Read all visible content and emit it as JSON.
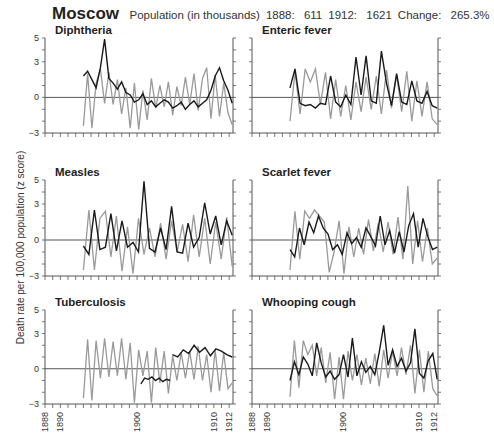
{
  "header": {
    "city": "Moscow",
    "population_label": "Population (in thousands)",
    "pop_1888_label": "1888:",
    "pop_1888": "611",
    "pop_1912_label": "1912:",
    "pop_1912": "1621",
    "change_label": "Change:",
    "change": "265.3%"
  },
  "y_axis_label": "Death rate per 100,000 population (z score)",
  "colors": {
    "black_series": "#1a1a1a",
    "gray_series": "#9a9a9a",
    "axis": "#555555"
  },
  "chart_data": {
    "type": "line",
    "title": "Moscow",
    "subtitle": "Population (in thousands) 1888: 611 1912: 1621 Change: 265.3%",
    "xlabel": "",
    "ylabel": "Death rate per 100,000 population (z score)",
    "xlim": [
      1888,
      1912.5
    ],
    "ylim": [
      -3,
      5
    ],
    "x_ticks": [
      1888,
      1890,
      1900,
      1910,
      1912
    ],
    "y_ticks": [
      -3,
      0,
      3,
      5
    ],
    "grid": false,
    "legend": "none",
    "panels": [
      {
        "title": "Diphtheria",
        "start": 1893,
        "series": [
          {
            "name": "black",
            "values": [
              1.8,
              2.2,
              1.5,
              0.8,
              2.5,
              4.9,
              1.6,
              1.2,
              0.7,
              1.3,
              0.4,
              0.2,
              -0.4,
              -0.2,
              0.3,
              -0.6,
              -0.3,
              -0.8,
              -0.5,
              -0.2,
              -0.4,
              -0.9,
              -0.7,
              -0.4,
              -1.0,
              -0.6,
              -0.3,
              -0.8,
              -0.5,
              -0.2,
              0.6,
              1.8,
              2.5,
              1.4,
              0.6,
              -0.5
            ]
          },
          {
            "name": "gray",
            "values": [
              -2.4,
              2.0,
              -2.6,
              1.2,
              2.4,
              -0.5,
              2.1,
              -0.6,
              1.5,
              -1.4,
              0.8,
              -2.6,
              1.2,
              -2.7,
              0.6,
              -1.9,
              1.6,
              -0.9,
              1.0,
              -0.8,
              1.3,
              -1.5,
              0.9,
              -0.7,
              1.7,
              -0.6,
              2.0,
              -1.1,
              1.6,
              2.5,
              -1.8,
              1.9,
              -1.6,
              1.2,
              -1.3,
              -2.3
            ]
          }
        ]
      },
      {
        "title": "Enteric fever",
        "start": 1893,
        "series": [
          {
            "name": "black",
            "values": [
              0.8,
              2.4,
              -0.5,
              -0.7,
              -0.6,
              -0.9,
              -0.5,
              -0.6,
              1.8,
              -0.4,
              -0.8,
              0.2,
              -0.6,
              3.4,
              0.2,
              3.5,
              -0.3,
              -0.5,
              3.9,
              1.2,
              -0.7,
              2.0,
              -0.4,
              -0.6,
              1.4,
              -0.3,
              -0.5,
              0.5,
              -0.7,
              -0.9
            ]
          },
          {
            "name": "gray",
            "values": [
              -2.0,
              2.2,
              -1.4,
              2.4,
              1.3,
              2.4,
              -0.6,
              2.1,
              -1.8,
              1.5,
              -1.6,
              1.0,
              -1.9,
              1.3,
              -1.2,
              1.7,
              -1.0,
              1.8,
              -1.4,
              2.3,
              -0.9,
              1.9,
              -1.2,
              2.2,
              -2.0,
              1.4,
              -1.6,
              1.3,
              -1.8,
              -2.3
            ]
          }
        ]
      },
      {
        "title": "Measles",
        "start": 1893,
        "series": [
          {
            "name": "black",
            "values": [
              -0.5,
              -1.2,
              2.5,
              -0.8,
              -0.6,
              2.2,
              -0.9,
              1.6,
              -0.6,
              -0.2,
              -1.0,
              4.9,
              -0.7,
              -1.0,
              1.0,
              -0.8,
              2.8,
              -1.0,
              -1.1,
              1.4,
              -0.6,
              0.2,
              3.1,
              0.5,
              2.0,
              -0.4,
              1.6,
              0.4
            ]
          },
          {
            "name": "gray",
            "values": [
              -2.5,
              2.5,
              -2.5,
              1.8,
              2.4,
              -1.4,
              2.0,
              -2.6,
              1.1,
              -2.8,
              1.8,
              -1.2,
              1.0,
              -1.4,
              1.4,
              -1.6,
              1.6,
              -1.0,
              1.3,
              -1.8,
              2.1,
              -1.4,
              1.8,
              -2.0,
              1.5,
              -1.6,
              1.9,
              -2.2
            ]
          }
        ]
      },
      {
        "title": "Scarlet fever",
        "start": 1893,
        "series": [
          {
            "name": "black",
            "values": [
              -0.8,
              -1.4,
              1.0,
              -0.4,
              1.5,
              0.6,
              2.0,
              1.0,
              0.5,
              -0.8,
              -0.4,
              -1.2,
              0.6,
              -0.3,
              0.2,
              -0.6,
              1.0,
              0.3,
              -0.5,
              2.0,
              -0.4,
              0.8,
              -1.1,
              0.7,
              -1.0,
              1.2,
              2.2,
              -0.6,
              1.8,
              0.3,
              -0.8,
              -0.6
            ]
          },
          {
            "name": "gray",
            "values": [
              -2.5,
              2.4,
              -1.6,
              2.4,
              1.8,
              2.5,
              2.0,
              1.5,
              -2.7,
              -1.0,
              1.6,
              -2.8,
              1.1,
              -1.4,
              1.0,
              -1.2,
              1.7,
              -0.9,
              1.4,
              -1.0,
              1.5,
              -1.2,
              1.9,
              -1.6,
              4.5,
              -2.0,
              1.6,
              -1.8,
              1.0,
              -2.0,
              -1.5
            ]
          }
        ]
      },
      {
        "title": "Tuberculosis",
        "start": 1893,
        "series": [
          {
            "name": "black",
            "note": "1900.5-1904.5 and 1905-1912.5 segments",
            "values": [
              -1.3,
              -0.8,
              -0.9,
              -0.7,
              -1.0,
              -0.8,
              -1.1,
              -0.9,
              -1.0,
              1.2,
              1.0,
              1.6,
              1.3,
              2.0,
              1.4,
              1.8,
              1.1,
              1.7,
              1.5,
              1.2,
              1.0
            ]
          },
          {
            "name": "gray",
            "values": [
              -2.5,
              2.5,
              -2.7,
              2.4,
              -0.8,
              2.6,
              -0.7,
              2.3,
              -0.6,
              2.6,
              -0.9,
              2.2,
              -2.9,
              1.6,
              -0.6,
              1.5,
              -2.9,
              1.8,
              -1.2,
              1.5,
              -2.1,
              1.1,
              -1.0,
              1.4,
              -0.8,
              1.5,
              -0.9,
              1.9,
              -1.0,
              1.2,
              -2.0,
              1.6,
              -1.9,
              1.4,
              -1.7,
              -1.2
            ]
          }
        ]
      },
      {
        "title": "Whooping cough",
        "start": 1893,
        "series": [
          {
            "name": "black",
            "values": [
              -1.0,
              0.6,
              -0.5,
              1.0,
              0.4,
              -0.6,
              2.2,
              0.5,
              -0.7,
              -0.2,
              -0.9,
              -0.5,
              1.2,
              -0.7,
              2.6,
              -0.6,
              0.6,
              -0.3,
              0.2,
              -0.5,
              1.4,
              3.7,
              0.3,
              1.6,
              0.2,
              0.9,
              -0.2,
              0.5,
              3.4,
              -0.4,
              -0.8,
              0.7,
              1.3,
              -0.9
            ]
          },
          {
            "name": "gray",
            "values": [
              -2.4,
              2.4,
              -1.6,
              2.4,
              1.2,
              2.0,
              -0.6,
              1.8,
              -1.2,
              1.4,
              -2.6,
              1.0,
              -2.6,
              1.5,
              -1.0,
              1.2,
              -1.4,
              0.9,
              -1.3,
              1.3,
              -1.5,
              1.6,
              -0.8,
              1.5,
              -0.6,
              1.8,
              -0.5,
              2.0,
              -2.1,
              1.6,
              -2.0,
              1.5,
              -1.7,
              -2.3
            ]
          }
        ]
      }
    ]
  }
}
